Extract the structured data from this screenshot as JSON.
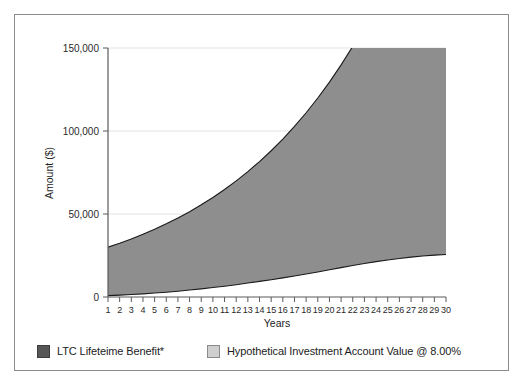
{
  "figure": {
    "background_color": "#ffffff",
    "frame_color": "#8b8b8b"
  },
  "legend": {
    "position": "bottom-left",
    "entries": [
      {
        "label": "LTC Lifeteime Benefit*",
        "swatch_color": "#565656",
        "swatch_style": "dark"
      },
      {
        "label": "Hypothetical Investment Account Value @ 8.00%",
        "swatch_color": "#cfcfcf",
        "swatch_style": "light"
      }
    ]
  },
  "chart_data": {
    "type": "area",
    "title": "",
    "subtitle": "",
    "xlabel": "Years",
    "ylabel": "Amount ($)",
    "xlim": [
      1,
      30
    ],
    "ylim": [
      0,
      150000
    ],
    "grid": true,
    "grid_axis": "y",
    "legend_position": "bottom-left",
    "ytick_labels": [
      "0",
      "50,000",
      "100,000",
      "150,000"
    ],
    "ytick_values": [
      0,
      50000,
      100000,
      150000
    ],
    "xtick_labels": [
      "1",
      "2",
      "3",
      "4",
      "5",
      "6",
      "7",
      "8",
      "9",
      "10",
      "11",
      "12",
      "13",
      "14",
      "15",
      "16",
      "17",
      "18",
      "19",
      "20",
      "21",
      "22",
      "23",
      "24",
      "25",
      "26",
      "27",
      "28",
      "29",
      "30"
    ],
    "categories": [
      1,
      2,
      3,
      4,
      5,
      6,
      7,
      8,
      9,
      10,
      11,
      12,
      13,
      14,
      15,
      16,
      17,
      18,
      19,
      20,
      21,
      22,
      23,
      24,
      25,
      26,
      27,
      28,
      29,
      30
    ],
    "series": [
      {
        "name": "Hypothetical Investment Account Value @ 8.00%",
        "fill_color": "#8e8e8e",
        "line_color": "#1a1a1a",
        "values": [
          30000,
          32400,
          34992,
          37791,
          40815,
          44080,
          47607,
          51415,
          55528,
          59970,
          64768,
          69949,
          75545,
          81589,
          88116,
          95165,
          102778,
          111000,
          119880,
          129470,
          139828,
          151014,
          163095,
          176143,
          190234,
          205453,
          221890,
          239641,
          258812,
          279517
        ]
      },
      {
        "name": "LTC Lifeteime Benefit*",
        "fill_color": "#8e8e8e",
        "line_color": "#1a1a1a",
        "values": [
          800,
          1100,
          1500,
          1900,
          2400,
          2900,
          3500,
          4200,
          4900,
          5700,
          6500,
          7400,
          8400,
          9400,
          10400,
          11500,
          12700,
          13900,
          15100,
          16400,
          17700,
          19000,
          20200,
          21300,
          22300,
          23200,
          24000,
          24700,
          25200,
          25600
        ]
      }
    ]
  }
}
